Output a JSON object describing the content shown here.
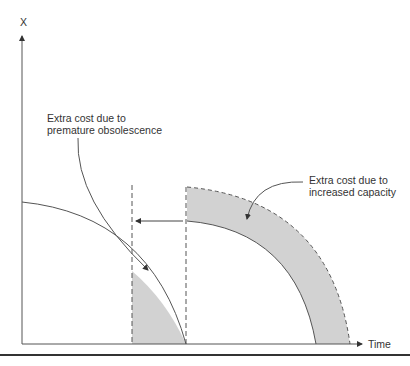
{
  "diagram": {
    "y_axis_label": "X",
    "x_axis_label": "Time",
    "annotations": {
      "premature": {
        "line1": "Extra cost due to",
        "line2": "premature obsolescence"
      },
      "capacity": {
        "line1": "Extra cost due to",
        "line2": "increased capacity"
      }
    },
    "colors": {
      "shade": "#d2d2d2",
      "line": "#555555",
      "rule": "#333333"
    }
  }
}
